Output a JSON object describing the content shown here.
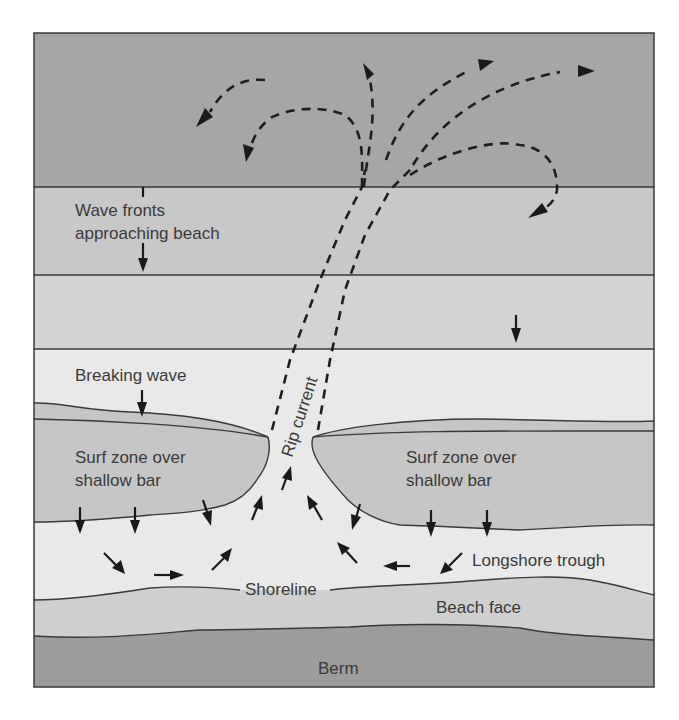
{
  "diagram": {
    "colors": {
      "deep_water": "#a6a6a6",
      "wave_band_1": "#c8c8c8",
      "wave_band_2": "#d6d6d6",
      "near_shore": "#e8e8e8",
      "surf_zone": "#c9c9c9",
      "trough": "#ebebeb",
      "beach_face": "#cfcfcf",
      "berm": "#9e9e9e",
      "line": "#3a3a3a",
      "arrow": "#1a1a1a"
    },
    "labels": {
      "wave_fronts_line1": "Wave fronts",
      "wave_fronts_line2": "approaching beach",
      "breaking_wave": "Breaking wave",
      "surf_zone_left_line1": "Surf zone over",
      "surf_zone_left_line2": "shallow bar",
      "surf_zone_right_line1": "Surf zone over",
      "surf_zone_right_line2": "shallow bar",
      "rip_current": "Rip current",
      "longshore_trough": "Longshore trough",
      "shoreline": "Shoreline",
      "beach_face": "Beach face",
      "berm": "Berm"
    },
    "zones": [
      "Deep water (rip head eddies)",
      "Wave fronts approaching beach",
      "Wave band",
      "Breaking wave",
      "Surf zone over shallow bar",
      "Longshore trough",
      "Beach face",
      "Berm"
    ]
  }
}
